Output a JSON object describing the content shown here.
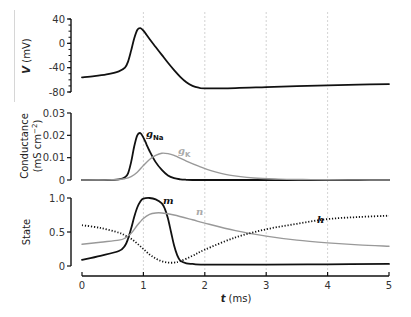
{
  "chart_data": [
    {
      "panel": "voltage",
      "type": "line",
      "xlabel": "",
      "ylabel": "V (mV)",
      "ylabel_parts": [
        "V",
        " (mV)"
      ],
      "ylim": [
        -80,
        40
      ],
      "yticks": [
        40,
        0,
        -40,
        -80
      ],
      "ytick_minor_step": 10,
      "xlim": [
        0,
        5
      ],
      "grid_x": [
        1,
        2,
        3,
        4
      ],
      "series": [
        {
          "name": "V",
          "color": "#111111",
          "style": "solid",
          "x": [
            0,
            0.2,
            0.4,
            0.6,
            0.7,
            0.75,
            0.8,
            0.85,
            0.9,
            0.95,
            1.0,
            1.05,
            1.1,
            1.2,
            1.3,
            1.4,
            1.5,
            1.6,
            1.7,
            1.8,
            1.9,
            2.0,
            2.5,
            3.0,
            3.5,
            4.0,
            4.5,
            5.0
          ],
          "y": [
            -56,
            -54,
            -51,
            -46,
            -40,
            -30,
            -12,
            8,
            22,
            25,
            21,
            14,
            7,
            -6,
            -19,
            -32,
            -44,
            -55,
            -64,
            -70,
            -73,
            -74,
            -73.5,
            -72,
            -70.5,
            -69,
            -68,
            -67
          ]
        }
      ]
    },
    {
      "panel": "conductance",
      "type": "line",
      "xlabel": "",
      "ylabel": "Conductance (mS cm−2)",
      "ylabel_line1": "Conductance",
      "ylabel_line2_prefix": "(mS cm",
      "ylabel_line2_sup": "−2",
      "ylabel_line2_suffix": ")",
      "ylim": [
        0,
        0.03
      ],
      "yticks": [
        0.03,
        0.02,
        0.01,
        0
      ],
      "ytick_labels": [
        "0.03",
        "0.02",
        "0.01",
        "0"
      ],
      "xlim": [
        0,
        5
      ],
      "grid_x": [
        1,
        2,
        3,
        4
      ],
      "series": [
        {
          "name": "gNa",
          "label_main": "g",
          "label_sub": "Na",
          "color": "#111111",
          "style": "solid",
          "x": [
            0,
            0.4,
            0.6,
            0.7,
            0.75,
            0.8,
            0.85,
            0.9,
            0.95,
            1.0,
            1.05,
            1.1,
            1.2,
            1.3,
            1.4,
            1.5,
            1.6,
            1.7,
            1.8,
            2.0,
            3.0,
            4.0,
            5.0
          ],
          "y": [
            0,
            0,
            0.0003,
            0.0012,
            0.003,
            0.008,
            0.015,
            0.02,
            0.021,
            0.019,
            0.016,
            0.013,
            0.008,
            0.0045,
            0.002,
            0.0008,
            0.0003,
            0.0001,
            0,
            0,
            0,
            0,
            0
          ]
        },
        {
          "name": "gK",
          "label_main": "g",
          "label_sub": "K",
          "color": "#999999",
          "style": "solid",
          "x": [
            0,
            0.5,
            0.7,
            0.8,
            0.9,
            1.0,
            1.1,
            1.2,
            1.3,
            1.4,
            1.5,
            1.7,
            1.9,
            2.1,
            2.4,
            2.8,
            3.2,
            3.6,
            4.0,
            4.5,
            5.0
          ],
          "y": [
            0,
            0.0001,
            0.0006,
            0.0015,
            0.0035,
            0.0065,
            0.0092,
            0.011,
            0.012,
            0.0118,
            0.011,
            0.0085,
            0.0062,
            0.0042,
            0.0022,
            0.0009,
            0.0004,
            0.0002,
            0.0001,
            5e-05,
            0
          ]
        }
      ]
    },
    {
      "panel": "state",
      "type": "line",
      "xlabel": "t (ms)",
      "xlabel_parts": [
        "t",
        " (ms)"
      ],
      "ylabel": "State",
      "ylim": [
        0,
        1
      ],
      "yticks": [
        1.0,
        0.5,
        0
      ],
      "ytick_labels": [
        "1.0",
        "0.5",
        "0"
      ],
      "xlim": [
        0,
        5
      ],
      "xticks": [
        0,
        1,
        2,
        3,
        4,
        5
      ],
      "xtick_labels": [
        "0",
        "1",
        "2",
        "3",
        "4",
        "5"
      ],
      "grid_x": [
        1,
        2,
        3,
        4
      ],
      "series": [
        {
          "name": "m",
          "label": "m",
          "color": "#111111",
          "style": "solid",
          "x": [
            0,
            0.3,
            0.6,
            0.7,
            0.75,
            0.8,
            0.85,
            0.9,
            0.95,
            1.0,
            1.1,
            1.2,
            1.3,
            1.35,
            1.4,
            1.45,
            1.5,
            1.55,
            1.6,
            1.7,
            1.8,
            2.0,
            3.0,
            4.0,
            5.0
          ],
          "y": [
            0.09,
            0.15,
            0.22,
            0.3,
            0.4,
            0.55,
            0.72,
            0.86,
            0.95,
            0.99,
            1.0,
            0.98,
            0.92,
            0.84,
            0.7,
            0.5,
            0.3,
            0.16,
            0.08,
            0.04,
            0.03,
            0.02,
            0.02,
            0.025,
            0.03
          ]
        },
        {
          "name": "n",
          "label": "n",
          "color": "#999999",
          "style": "solid",
          "x": [
            0,
            0.3,
            0.6,
            0.7,
            0.8,
            0.9,
            1.0,
            1.1,
            1.2,
            1.3,
            1.5,
            1.8,
            2.0,
            2.5,
            3.0,
            3.5,
            4.0,
            4.5,
            5.0
          ],
          "y": [
            0.32,
            0.35,
            0.38,
            0.41,
            0.48,
            0.6,
            0.7,
            0.76,
            0.78,
            0.78,
            0.75,
            0.68,
            0.63,
            0.52,
            0.44,
            0.38,
            0.34,
            0.31,
            0.29
          ]
        },
        {
          "name": "h",
          "label": "h",
          "color": "#111111",
          "style": "dotted",
          "x": [
            0,
            0.3,
            0.6,
            0.7,
            0.8,
            0.9,
            1.0,
            1.1,
            1.2,
            1.3,
            1.4,
            1.5,
            1.6,
            1.8,
            2.0,
            2.5,
            3.0,
            3.5,
            4.0,
            4.5,
            5.0
          ],
          "y": [
            0.6,
            0.56,
            0.49,
            0.45,
            0.4,
            0.33,
            0.25,
            0.17,
            0.11,
            0.07,
            0.05,
            0.05,
            0.07,
            0.15,
            0.24,
            0.42,
            0.54,
            0.62,
            0.69,
            0.72,
            0.74
          ]
        }
      ]
    }
  ]
}
